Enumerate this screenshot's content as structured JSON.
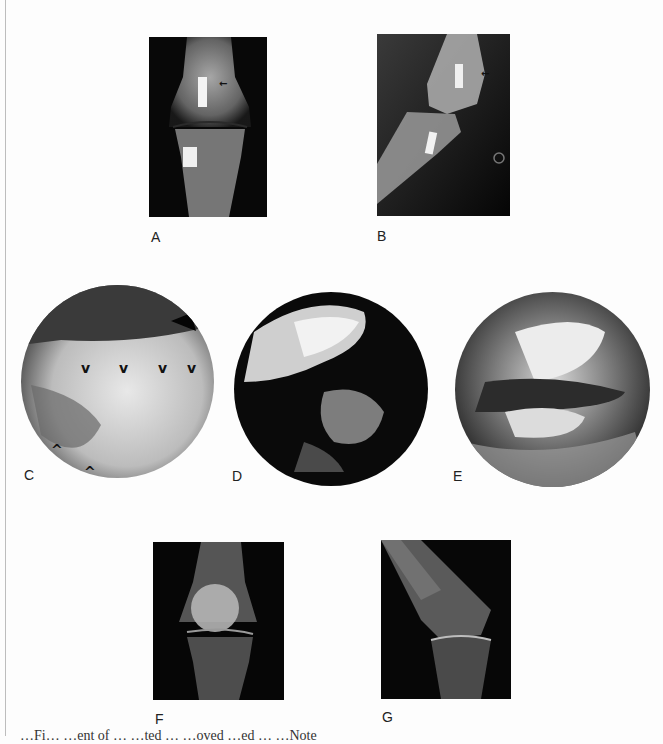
{
  "figure": {
    "panels": [
      {
        "id": "A",
        "label": "A",
        "kind": "radiograph-ap-knee"
      },
      {
        "id": "B",
        "label": "B",
        "kind": "radiograph-lateral-knee"
      },
      {
        "id": "C",
        "label": "C",
        "kind": "arthroscopic-view"
      },
      {
        "id": "D",
        "label": "D",
        "kind": "arthroscopic-view"
      },
      {
        "id": "E",
        "label": "E",
        "kind": "arthroscopic-view"
      },
      {
        "id": "F",
        "label": "F",
        "kind": "radiograph-ap-knee"
      },
      {
        "id": "G",
        "label": "G",
        "kind": "radiograph-lateral-knee"
      }
    ],
    "annotations": {
      "c_arrowheads_top": [
        "v",
        "v",
        "v",
        "v"
      ],
      "c_arrowheads_bottom": [
        "^",
        "^"
      ]
    },
    "caption_fragment": "…Fi… …ent of … …ted … …oved …ed … …Note"
  }
}
